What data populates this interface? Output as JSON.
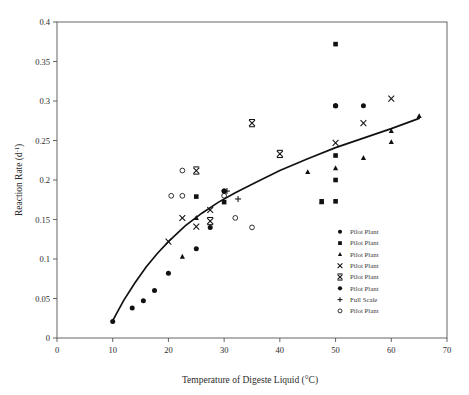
{
  "chart_data": {
    "type": "scatter",
    "title": "",
    "xlabel": "Temperature of Digeste  Liquid (°C)",
    "ylabel_main": "Reaction Rate (d",
    "ylabel_sup": "-1",
    "ylabel_tail": ")",
    "xlim": [
      0,
      70
    ],
    "ylim": [
      0,
      0.4
    ],
    "xticks": [
      0,
      10,
      20,
      30,
      40,
      50,
      60,
      70
    ],
    "xtick_labels": [
      "0",
      "10",
      "20",
      "30",
      "40",
      "50",
      "60",
      "70"
    ],
    "yticks": [
      0,
      0.05,
      0.1,
      0.15,
      0.2,
      0.25,
      0.3,
      0.35,
      0.4
    ],
    "ytick_labels": [
      "0",
      "0.05",
      "0.1",
      "0.15",
      "0.2",
      "0.25",
      "0.3",
      "0.35",
      "0.4"
    ],
    "grid": false,
    "legend_position": "inside-lower-right",
    "series": [
      {
        "name": "Pilot Plant",
        "marker": "filled-diamond",
        "points": [
          {
            "x": 10.0,
            "y": 0.021
          },
          {
            "x": 13.5,
            "y": 0.038
          },
          {
            "x": 15.5,
            "y": 0.047
          },
          {
            "x": 17.5,
            "y": 0.06
          },
          {
            "x": 20.0,
            "y": 0.082
          },
          {
            "x": 25.0,
            "y": 0.113
          },
          {
            "x": 27.5,
            "y": 0.14
          },
          {
            "x": 30.0,
            "y": 0.186
          },
          {
            "x": 50.0,
            "y": 0.294
          },
          {
            "x": 55.0,
            "y": 0.294
          }
        ]
      },
      {
        "name": "Pilot Plant",
        "marker": "filled-square",
        "points": [
          {
            "x": 25.0,
            "y": 0.179
          },
          {
            "x": 30.0,
            "y": 0.172
          },
          {
            "x": 47.5,
            "y": 0.173
          },
          {
            "x": 50.0,
            "y": 0.372
          },
          {
            "x": 50.0,
            "y": 0.231
          },
          {
            "x": 50.0,
            "y": 0.2
          },
          {
            "x": 50.0,
            "y": 0.173
          }
        ]
      },
      {
        "name": "Pilot Plant",
        "marker": "filled-triangle",
        "points": [
          {
            "x": 22.5,
            "y": 0.103
          },
          {
            "x": 25.0,
            "y": 0.152
          },
          {
            "x": 45.0,
            "y": 0.21
          },
          {
            "x": 47.5,
            "y": 0.172
          },
          {
            "x": 50.0,
            "y": 0.215
          },
          {
            "x": 55.0,
            "y": 0.228
          },
          {
            "x": 60.0,
            "y": 0.262
          },
          {
            "x": 65.0,
            "y": 0.281
          },
          {
            "x": 60.0,
            "y": 0.248
          }
        ]
      },
      {
        "name": "Pilot Plant",
        "marker": "x-cross",
        "points": [
          {
            "x": 20.0,
            "y": 0.122
          },
          {
            "x": 22.5,
            "y": 0.152
          },
          {
            "x": 25.0,
            "y": 0.141
          },
          {
            "x": 27.5,
            "y": 0.162
          },
          {
            "x": 50.0,
            "y": 0.247
          },
          {
            "x": 55.0,
            "y": 0.272
          },
          {
            "x": 60.0,
            "y": 0.303
          }
        ]
      },
      {
        "name": "Pilot Plant",
        "marker": "bold-x",
        "points": [
          {
            "x": 25.0,
            "y": 0.212
          },
          {
            "x": 27.5,
            "y": 0.148
          },
          {
            "x": 35.0,
            "y": 0.272
          },
          {
            "x": 40.0,
            "y": 0.233
          }
        ]
      },
      {
        "name": "Pilot Plant",
        "marker": "filled-circle",
        "points": [
          {
            "x": 30.0,
            "y": 0.186
          },
          {
            "x": 50.0,
            "y": 0.294
          }
        ]
      },
      {
        "name": "Full Scale",
        "marker": "plus",
        "points": [
          {
            "x": 30.5,
            "y": 0.186
          },
          {
            "x": 32.5,
            "y": 0.176
          }
        ]
      },
      {
        "name": "Pilot Plant",
        "marker": "open-circle",
        "points": [
          {
            "x": 22.5,
            "y": 0.212
          },
          {
            "x": 22.5,
            "y": 0.18
          },
          {
            "x": 20.5,
            "y": 0.18
          },
          {
            "x": 30.0,
            "y": 0.18
          },
          {
            "x": 32.0,
            "y": 0.152
          },
          {
            "x": 35.0,
            "y": 0.14
          }
        ]
      }
    ],
    "fit_curve": {
      "description": "logarithmic trend line through data",
      "points": [
        {
          "x": 10.0,
          "y": 0.022
        },
        {
          "x": 12.0,
          "y": 0.048
        },
        {
          "x": 14.0,
          "y": 0.07
        },
        {
          "x": 16.0,
          "y": 0.09
        },
        {
          "x": 18.0,
          "y": 0.107
        },
        {
          "x": 20.0,
          "y": 0.122
        },
        {
          "x": 23.0,
          "y": 0.142
        },
        {
          "x": 26.0,
          "y": 0.158
        },
        {
          "x": 29.0,
          "y": 0.172
        },
        {
          "x": 32.0,
          "y": 0.184
        },
        {
          "x": 36.0,
          "y": 0.198
        },
        {
          "x": 40.0,
          "y": 0.212
        },
        {
          "x": 45.0,
          "y": 0.227
        },
        {
          "x": 50.0,
          "y": 0.241
        },
        {
          "x": 55.0,
          "y": 0.253
        },
        {
          "x": 60.0,
          "y": 0.265
        },
        {
          "x": 65.0,
          "y": 0.278
        }
      ]
    },
    "legend": [
      {
        "marker": "filled-diamond",
        "label": "Pilot Plant"
      },
      {
        "marker": "filled-square",
        "label": "Pilot Plant"
      },
      {
        "marker": "filled-triangle",
        "label": "Pilot Plant"
      },
      {
        "marker": "x-cross",
        "label": "Pilot Plant"
      },
      {
        "marker": "bold-x",
        "label": "Pilot Plant"
      },
      {
        "marker": "filled-circle",
        "label": "Pilot Plant"
      },
      {
        "marker": "plus",
        "label": "Full Scale"
      },
      {
        "marker": "open-circle",
        "label": "Pilot Plant"
      }
    ],
    "colors": {
      "marker": "#111111",
      "curve": "#111111",
      "axis": "#555555",
      "text": "#2b2b2b"
    }
  }
}
